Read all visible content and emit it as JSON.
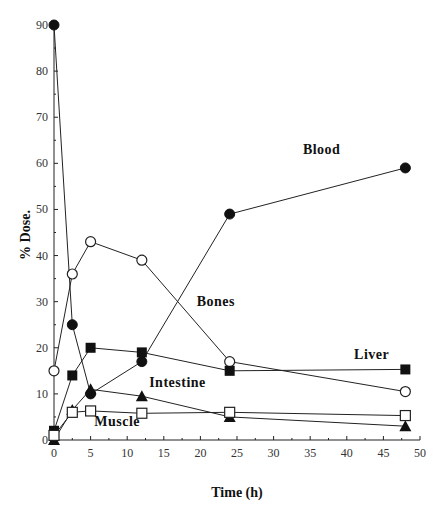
{
  "chart_data": {
    "type": "line",
    "title": "",
    "xlabel": "Time (h)",
    "ylabel": "% Dose.",
    "xlim": [
      0,
      50
    ],
    "ylim": [
      0,
      90
    ],
    "grid": false,
    "legend": "inline labels",
    "x_ticks": [
      0,
      5,
      10,
      15,
      20,
      25,
      30,
      35,
      40,
      45,
      50
    ],
    "y_ticks": [
      0,
      10,
      20,
      30,
      40,
      50,
      60,
      70,
      80,
      90
    ],
    "series": [
      {
        "name": "Blood",
        "marker": "filled-circle",
        "x": [
          0,
          2.5,
          5,
          12,
          24,
          48
        ],
        "values": [
          90,
          25,
          10,
          17,
          49,
          59
        ]
      },
      {
        "name": "Bones",
        "marker": "open-circle",
        "x": [
          0,
          2.5,
          5,
          12,
          24,
          48
        ],
        "values": [
          15,
          36,
          43,
          39,
          17,
          10.5
        ]
      },
      {
        "name": "Liver",
        "marker": "filled-square",
        "x": [
          0,
          2.5,
          5,
          12,
          24,
          48
        ],
        "values": [
          2,
          14,
          20,
          19,
          15,
          15.3
        ]
      },
      {
        "name": "Intestine",
        "marker": "filled-triangle",
        "x": [
          0,
          2.5,
          5,
          12,
          24,
          48
        ],
        "values": [
          0,
          6.5,
          11,
          9.5,
          5,
          3
        ]
      },
      {
        "name": "Muscle",
        "marker": "open-square",
        "x": [
          0,
          2.5,
          5,
          12,
          24,
          48
        ],
        "values": [
          1,
          6,
          6.3,
          5.8,
          6,
          5.3
        ]
      }
    ],
    "annotations": [
      {
        "text": "Blood",
        "x": 34,
        "y": 62
      },
      {
        "text": "Bones",
        "x": 19.5,
        "y": 29
      },
      {
        "text": "Liver",
        "x": 41,
        "y": 17.5
      },
      {
        "text": "Intestine",
        "x": 13,
        "y": 11.5
      },
      {
        "text": "Muscle",
        "x": 5.5,
        "y": 3
      }
    ]
  }
}
